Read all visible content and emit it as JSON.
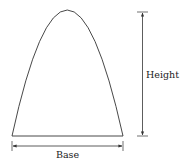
{
  "diagram": {
    "shape": "parabolic-arch",
    "labels": {
      "height": "Height",
      "base": "Base"
    },
    "colors": {
      "stroke": "#333333",
      "text": "#222222",
      "background": "#ffffff"
    }
  }
}
